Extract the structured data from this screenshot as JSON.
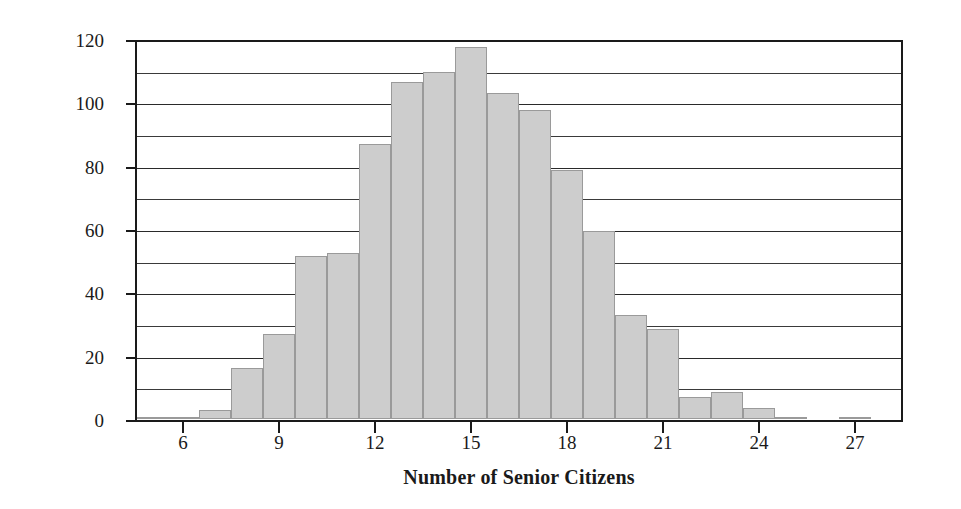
{
  "chart_data": {
    "type": "bar",
    "title": "",
    "xlabel": "Number of Senior Citizens",
    "ylabel": "Number of Jury Pools",
    "xlim": [
      4.5,
      28.5
    ],
    "ylim": [
      0,
      120
    ],
    "grid": "horizontal",
    "legend": "none",
    "bar_fill_color": "#cdcdcd",
    "bar_border_color": "#9a9a9a",
    "axis_color": "#1a1a1a",
    "y_tick_labels": [
      "0",
      "20",
      "40",
      "60",
      "80",
      "100",
      "120"
    ],
    "y_tick_values": [
      0,
      20,
      40,
      60,
      80,
      100,
      120
    ],
    "y_gridline_values": [
      10,
      20,
      30,
      40,
      50,
      60,
      70,
      80,
      90,
      100,
      110,
      120
    ],
    "x_tick_labels": [
      "6",
      "9",
      "12",
      "15",
      "18",
      "21",
      "24",
      "27"
    ],
    "x_tick_values": [
      6,
      9,
      12,
      15,
      18,
      21,
      24,
      27
    ],
    "categories": [
      5,
      6,
      7,
      8,
      9,
      10,
      11,
      12,
      13,
      14,
      15,
      16,
      17,
      18,
      19,
      20,
      21,
      22,
      23,
      24,
      25,
      26,
      27,
      28
    ],
    "values": [
      0.5,
      0.5,
      3,
      16,
      27,
      51.5,
      52.5,
      87,
      106.5,
      109.5,
      117.5,
      103,
      97.5,
      78.5,
      59.5,
      33,
      28.5,
      7,
      8.5,
      3.5,
      0.5,
      0,
      0.5,
      0
    ],
    "bin_edges": [
      4.5,
      5.5,
      6.5,
      7.5,
      8.5,
      9.5,
      10.5,
      11.5,
      12.5,
      13.5,
      14.5,
      15.5,
      16.5,
      17.5,
      18.5,
      19.5,
      20.5,
      21.5,
      22.5,
      23.5,
      24.5,
      25.5,
      26.5,
      27.5,
      28.5
    ]
  }
}
